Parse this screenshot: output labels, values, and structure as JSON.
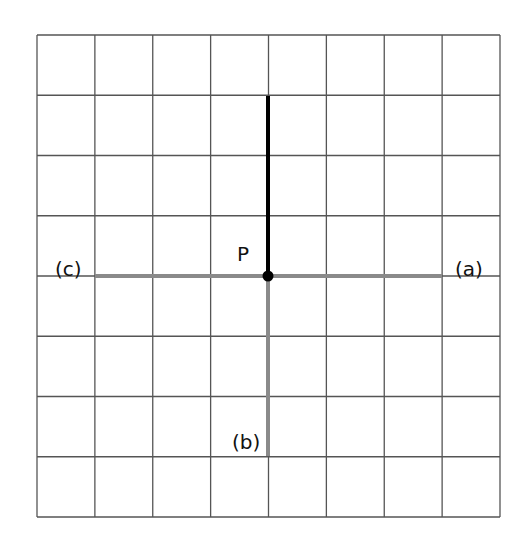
{
  "grid": {
    "left": 37,
    "top": 35,
    "right": 500,
    "bottom": 517,
    "columns": 8,
    "rows": 8,
    "line_color": "#555555"
  },
  "point": {
    "label": "P",
    "x": 268,
    "y": 276,
    "color": "#000000"
  },
  "segments": {
    "up": {
      "x1": 268,
      "y1": 96,
      "x2": 268,
      "y2": 276,
      "color": "#000000",
      "width": 4
    },
    "a": {
      "label": "(a)",
      "x1": 268,
      "y1": 276,
      "x2": 442,
      "y2": 276,
      "color": "#8a8a8a",
      "width": 4
    },
    "b": {
      "label": "(b)",
      "x1": 268,
      "y1": 276,
      "x2": 268,
      "y2": 456,
      "color": "#8a8a8a",
      "width": 4
    },
    "c": {
      "label": "(c)",
      "x1": 95,
      "y1": 276,
      "x2": 268,
      "y2": 276,
      "color": "#8a8a8a",
      "width": 4
    }
  },
  "labels": {
    "P": "P",
    "a": "(a)",
    "b": "(b)",
    "c": "(c)"
  }
}
